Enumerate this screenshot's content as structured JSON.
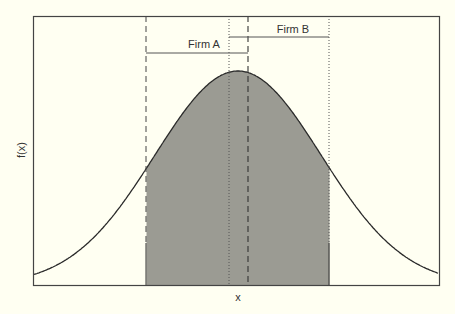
{
  "chart_data": {
    "type": "area",
    "title": "",
    "xlabel": "x",
    "ylabel": "f(x)",
    "curve": "normal density (bell curve)",
    "mean": 0,
    "sd": 1,
    "xlim": [
      -3.5,
      3.5
    ],
    "shaded_region": {
      "from": -1.1,
      "to": 1.1,
      "fill": "#9b9b93"
    },
    "vertical_lines": [
      {
        "name": "firm-a-left",
        "x": -1.1,
        "style": "dashed"
      },
      {
        "name": "firm-b-left",
        "x": -0.11,
        "style": "dotted"
      },
      {
        "name": "firm-a-right",
        "x": 0.12,
        "style": "dashed"
      },
      {
        "name": "firm-b-right",
        "x": 1.1,
        "style": "dotted"
      }
    ],
    "brackets": [
      {
        "label": "Firm A",
        "from": -1.1,
        "to": 0.12
      },
      {
        "label": "Firm B",
        "from": -0.11,
        "to": 1.1
      }
    ],
    "ticks": "none",
    "grid": false,
    "legend": "none"
  },
  "labels": {
    "x_axis": "x",
    "y_axis": "f(x)",
    "firm_a": "Firm A",
    "firm_b": "Firm B"
  },
  "colors": {
    "background": "#fffff2",
    "fill": "#9b9b93",
    "line": "#2a2a2a"
  }
}
